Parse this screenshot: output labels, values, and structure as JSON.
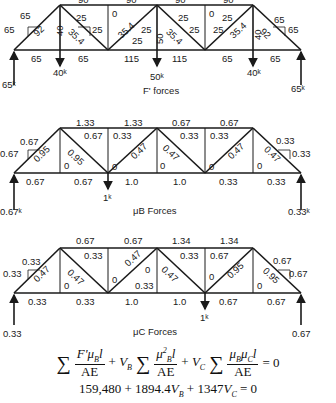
{
  "diagrams": [
    {
      "caption": "F' forces",
      "top_chord": [
        "90",
        "90",
        "90",
        "90"
      ],
      "bottom_chord": [
        "65",
        "65",
        "115",
        "115",
        "65",
        "65"
      ],
      "diagonals": [
        "92",
        "35.4",
        "35.4",
        "35.4",
        "35.4",
        "92"
      ],
      "verticals": [
        "40",
        "0",
        "50",
        "0",
        "40"
      ],
      "components": [
        "65",
        "65",
        "25",
        "25",
        "25",
        "25",
        "25",
        "25",
        "25",
        "25",
        "65",
        "65"
      ],
      "loads": [
        "40k",
        "50k",
        "40k"
      ],
      "reactions": [
        "65k",
        "65k"
      ]
    },
    {
      "caption": "μB Forces",
      "top_chord": [
        "1.33",
        "1.33",
        "0.67",
        "0.67"
      ],
      "bottom_chord": [
        "0.67",
        "0.67",
        "1.0",
        "1.0",
        "0.33",
        "0.33"
      ],
      "diagonals": [
        "0.95",
        "0.95",
        "0.47",
        "0.47",
        "0.47",
        "0.47"
      ],
      "verticals": [
        "0",
        "0",
        "0",
        "0",
        "0"
      ],
      "components": [
        "0.67",
        "0.67",
        "0.67",
        "0.33",
        "0.33",
        "0.33",
        "0.33",
        "0.33"
      ],
      "loads": [
        "1k"
      ],
      "reactions": [
        "0.67k",
        "0.33k"
      ]
    },
    {
      "caption": "μC Forces",
      "top_chord": [
        "0.67",
        "0.67",
        "1.34",
        "1.34"
      ],
      "bottom_chord": [
        "0.33",
        "0.33",
        "1.0",
        "1.0",
        "0.67",
        "0.67"
      ],
      "diagonals": [
        "0.47",
        "0.47",
        "0.47",
        "0.47",
        "0.95",
        "0.95"
      ],
      "verticals": [
        "0",
        "0",
        "0",
        "0",
        "0"
      ],
      "components": [
        "0.33",
        "0.33",
        "0.33",
        "0.33",
        "0.33",
        "0.67",
        "0.67",
        "0.67"
      ],
      "loads": [
        "1k"
      ],
      "reactions": [
        "0.33",
        "0.67"
      ]
    }
  ],
  "equations": {
    "line1": "Σ F'μBl/AE + VB Σ μB²l/AE + VC Σ μBμCl/AE = 0",
    "line2": "159,480 + 1894.4VB + 1347VC = 0"
  }
}
